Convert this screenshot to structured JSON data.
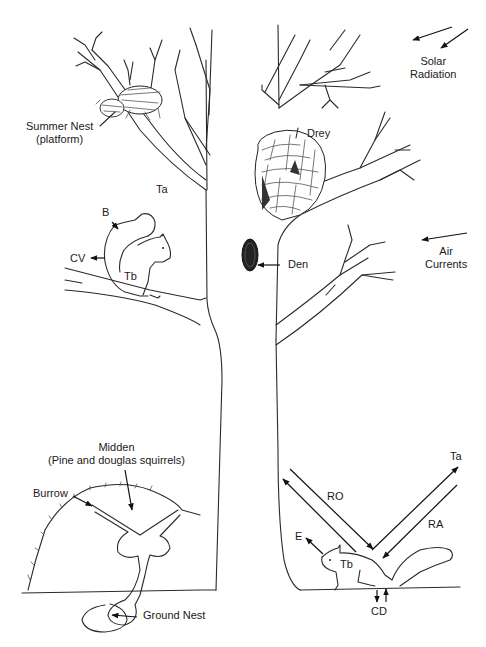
{
  "figure": {
    "labels": {
      "summer_nest": "Summer Nest",
      "summer_nest_sub": "(platform)",
      "ta_top": "Ta",
      "b": "B",
      "cv": "CV",
      "tb_upper": "Tb",
      "drey": "Drey",
      "den": "Den",
      "solar_1": "Solar",
      "solar_2": "Radiation",
      "air_1": "Air",
      "air_2": "Currents",
      "midden": "Midden",
      "midden_sub": "(Pine and douglas squirrels)",
      "burrow": "Burrow",
      "ground_nest": "Ground Nest",
      "ro": "RO",
      "ra": "RA",
      "ta_bottom": "Ta",
      "e": "E",
      "tb_lower": "Tb",
      "cd": "CD"
    },
    "colors": {
      "ink": "#2a2a2a",
      "background": "#ffffff"
    }
  }
}
